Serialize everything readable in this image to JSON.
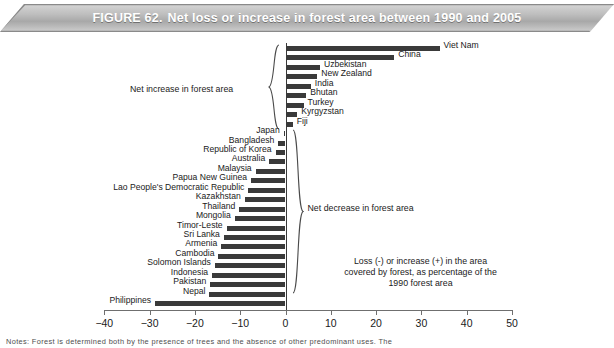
{
  "banner": {
    "figure_number": "FIGURE 62.",
    "title": "Net loss or increase in forest area between 1990 and 2005"
  },
  "annotations": {
    "increase_bracket": "Net increase in forest area",
    "decrease_bracket": "Net decrease in forest area",
    "caption_line1": "Loss (-) or increase (+) in the area",
    "caption_line2": "covered by forest, as percentage of the",
    "caption_line3": "1990 forest area"
  },
  "footnote": "Notes: Forest is determined both by the presence of trees and the absence of other predominant uses. The",
  "chart_data": {
    "type": "bar",
    "orientation": "horizontal",
    "title": "Net loss or increase in forest area between 1990 and 2005",
    "xlabel": "Loss (-) or increase (+) in the area covered by forest, as percentage of the 1990 forest area",
    "ylabel": "",
    "xlim": [
      -40,
      50
    ],
    "xticks": [
      -40,
      -30,
      -20,
      -10,
      0,
      10,
      20,
      30,
      40,
      50
    ],
    "xtick_labels": [
      "−40",
      "−30",
      "−20",
      "−10",
      "0",
      "10",
      "20",
      "30",
      "40",
      "50"
    ],
    "grid": false,
    "legend": "none",
    "categories": [
      "Viet Nam",
      "China",
      "Uzbekistan",
      "New Zealand",
      "India",
      "Bhutan",
      "Turkey",
      "Kyrgyzstan",
      "Fiji",
      "Japan",
      "Bangladesh",
      "Republic of Korea",
      "Australia",
      "Malaysia",
      "Papua New Guinea",
      "Lao People's Democratic Republic",
      "Kazakhstan",
      "Thailand",
      "Mongolia",
      "Timor-Leste",
      "Sri Lanka",
      "Armenia",
      "Cambodia",
      "Solomon Islands",
      "Indonesia",
      "Pakistan",
      "Nepal",
      "Philippines"
    ],
    "values": [
      34.0,
      24.0,
      7.6,
      7.0,
      5.6,
      4.6,
      4.0,
      2.6,
      1.6,
      -0.4,
      -1.6,
      -2.2,
      -3.6,
      -6.6,
      -7.6,
      -8.2,
      -9.0,
      -10.2,
      -11.2,
      -13.0,
      -13.6,
      -14.2,
      -14.8,
      -15.6,
      -16.2,
      -16.6,
      -16.8,
      -28.8
    ],
    "label_sides": [
      "right",
      "right",
      "right",
      "right",
      "right",
      "right",
      "right",
      "right",
      "right",
      "left",
      "left",
      "left",
      "left",
      "left",
      "left",
      "left",
      "left",
      "left",
      "left",
      "left",
      "left",
      "left",
      "left",
      "left",
      "left",
      "left",
      "left",
      "left"
    ],
    "bar_color": "#3a3a3a",
    "axis_color": "#6f6f6f"
  }
}
